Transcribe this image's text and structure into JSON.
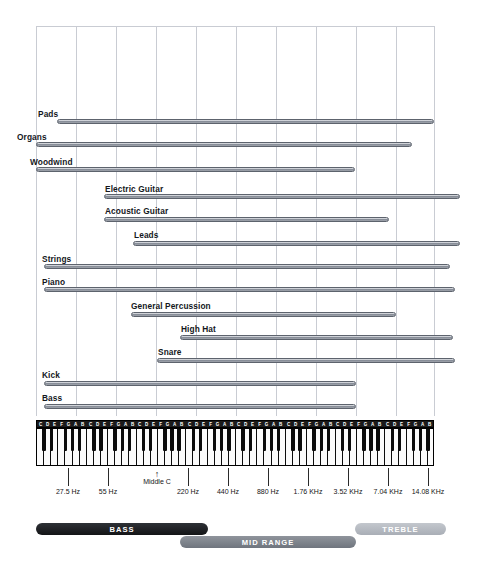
{
  "chart_data": {
    "type": "bar",
    "xlabel": "Frequency",
    "ylabel": "",
    "axis": {
      "scale": "log2-octave",
      "tick_labels": [
        "27.5 Hz",
        "55 Hz",
        "220 Hz",
        "440 Hz",
        "880 Hz",
        "1.76 KHz",
        "3.52 KHz",
        "7.04 KHz",
        "14.08 KHz"
      ],
      "tick_x": [
        68,
        108,
        188,
        228,
        268,
        308,
        348,
        388,
        428
      ],
      "grid": true,
      "gridline_x": [
        36,
        76,
        116,
        156,
        196,
        236,
        276,
        316,
        356,
        396,
        434
      ]
    },
    "middle_c": {
      "label": "Middle C",
      "arrow": "↑",
      "x": 157
    },
    "categories": [
      "Pads",
      "Organs",
      "Woodwind",
      "Electric Guitar",
      "Acoustic Guitar",
      "Leads",
      "Strings",
      "Piano",
      "General Percussion",
      "High Hat",
      "Snare",
      "Kick",
      "Bass"
    ],
    "bars": [
      {
        "label": "Pads",
        "x1": 57,
        "x2": 434,
        "y": 119,
        "label_x": 38,
        "label_y": 109
      },
      {
        "label": "Organs",
        "x1": 36,
        "x2": 412,
        "y": 142,
        "label_x": 17,
        "label_y": 132
      },
      {
        "label": "Woodwind",
        "x1": 36,
        "x2": 355,
        "y": 167,
        "label_x": 30,
        "label_y": 157
      },
      {
        "label": "Electric Guitar",
        "x1": 104,
        "x2": 460,
        "y": 194,
        "label_x": 105,
        "label_y": 184
      },
      {
        "label": "Acoustic Guitar",
        "x1": 104,
        "x2": 389,
        "y": 217,
        "label_x": 105,
        "label_y": 206
      },
      {
        "label": "Leads",
        "x1": 133,
        "x2": 460,
        "y": 241,
        "label_x": 134,
        "label_y": 230
      },
      {
        "label": "Strings",
        "x1": 44,
        "x2": 450,
        "y": 264,
        "label_x": 42,
        "label_y": 254
      },
      {
        "label": "Piano",
        "x1": 44,
        "x2": 455,
        "y": 287,
        "label_x": 42,
        "label_y": 277
      },
      {
        "label": "General Percussion",
        "x1": 131,
        "x2": 396,
        "y": 312,
        "label_x": 131,
        "label_y": 301
      },
      {
        "label": "High Hat",
        "x1": 180,
        "x2": 453,
        "y": 335,
        "label_x": 181,
        "label_y": 324
      },
      {
        "label": "Snare",
        "x1": 157,
        "x2": 455,
        "y": 358,
        "label_x": 158,
        "label_y": 347
      },
      {
        "label": "Kick",
        "x1": 44,
        "x2": 356,
        "y": 381,
        "label_x": 42,
        "label_y": 370
      },
      {
        "label": "Bass",
        "x1": 44,
        "x2": 356,
        "y": 404,
        "label_x": 42,
        "label_y": 393
      }
    ],
    "keyboard": {
      "octaves": 8,
      "note_letters": [
        "C",
        "D",
        "E",
        "F",
        "G",
        "A",
        "B"
      ],
      "left": 36,
      "right": 434
    },
    "ranges": [
      {
        "label": "BASS",
        "x1": 36,
        "x2": 208,
        "y": 523,
        "style": "bass"
      },
      {
        "label": "MID RANGE",
        "x1": 180,
        "x2": 356,
        "y": 536,
        "style": "mid"
      },
      {
        "label": "TREBLE",
        "x1": 355,
        "x2": 446,
        "y": 523,
        "style": "treble"
      }
    ]
  }
}
